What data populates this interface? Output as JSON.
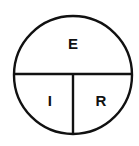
{
  "diagram": {
    "shape": "circle-divided-into-three-segments",
    "background_color": "#ffffff",
    "stroke_color": "#111111",
    "text_color": "#111111",
    "stroke_width": 2.4,
    "circle": {
      "center_x": 73,
      "center_y": 75,
      "radius": 59
    },
    "dividers": {
      "horizontal_y": 74,
      "vertical_x": 73
    },
    "segments": [
      {
        "id": "top",
        "label": "E",
        "name": "segment-top",
        "x": 73,
        "y": 45
      },
      {
        "id": "bottom-left",
        "label": "I",
        "name": "segment-bottom-left",
        "x": 50,
        "y": 102
      },
      {
        "id": "bottom-right",
        "label": "R",
        "name": "segment-bottom-right",
        "x": 101,
        "y": 102
      }
    ]
  }
}
